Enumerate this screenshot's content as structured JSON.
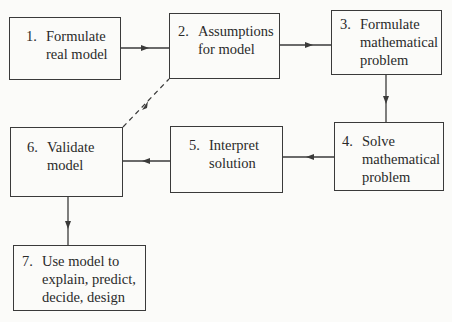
{
  "diagram": {
    "type": "flowchart",
    "steps": [
      {
        "id": 1,
        "number": "1.",
        "lines": [
          "Formulate",
          "real model"
        ]
      },
      {
        "id": 2,
        "number": "2.",
        "lines": [
          "Assumptions",
          "for model"
        ]
      },
      {
        "id": 3,
        "number": "3.",
        "lines": [
          "Formulate",
          "mathematical",
          "problem"
        ]
      },
      {
        "id": 4,
        "number": "4.",
        "lines": [
          "Solve",
          "mathematical",
          "problem"
        ]
      },
      {
        "id": 5,
        "number": "5.",
        "lines": [
          "Interpret",
          "solution"
        ]
      },
      {
        "id": 6,
        "number": "6.",
        "lines": [
          "Validate",
          "model"
        ]
      },
      {
        "id": 7,
        "number": "7.",
        "lines": [
          "Use model to",
          "explain, predict,",
          "decide, design"
        ]
      }
    ],
    "edges": [
      {
        "from": 1,
        "to": 2,
        "style": "solid"
      },
      {
        "from": 2,
        "to": 3,
        "style": "solid"
      },
      {
        "from": 3,
        "to": 4,
        "style": "solid"
      },
      {
        "from": 4,
        "to": 5,
        "style": "solid"
      },
      {
        "from": 5,
        "to": 6,
        "style": "solid"
      },
      {
        "from": 6,
        "to": 2,
        "style": "dashed"
      },
      {
        "from": 6,
        "to": 7,
        "style": "solid"
      }
    ],
    "colors": {
      "line": "#3a3a3a",
      "background": "#fbfbf9",
      "text": "#2a2a2a"
    }
  }
}
